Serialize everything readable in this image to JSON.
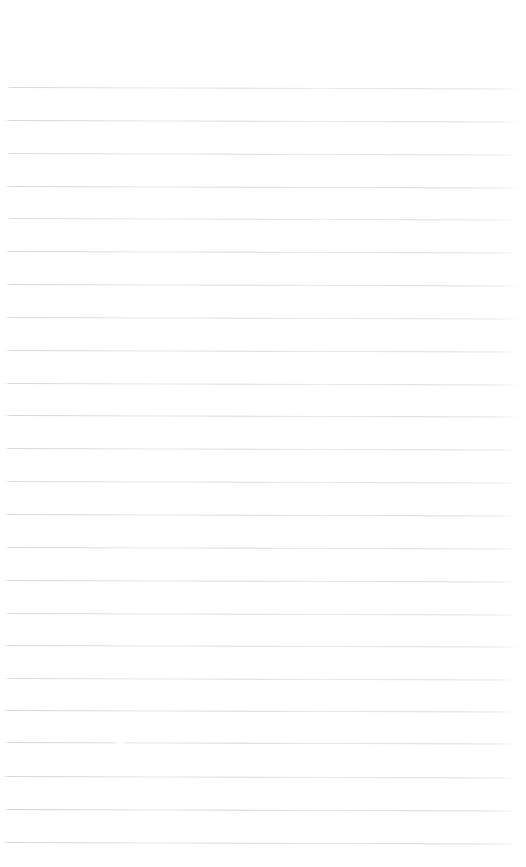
{
  "document": {
    "kind": "scanned-blank-ruled-paper",
    "page_label": "",
    "body_text": "",
    "has_text_content": false,
    "background_color": "#ffffff",
    "width_px": 526,
    "height_px": 867
  },
  "ruling": {
    "line_color": "#d4d7db",
    "line_color_dark": "#c6c9cd",
    "line_thickness_px": 1,
    "line_count": 24,
    "first_line_y": 87,
    "last_line_y": 842,
    "line_spacing_px": 32.8,
    "left_margin_px": 5,
    "right_edge_px": 521,
    "skew_degrees": 0.16,
    "top_blank_margin_px": 87,
    "bottom_blank_margin_px": 25,
    "lines": [
      {
        "y": 87,
        "x_start": 6,
        "x_end": 521,
        "opacity": 0.8
      },
      {
        "y": 120,
        "x_start": 5,
        "x_end": 521,
        "opacity": 0.86
      },
      {
        "y": 153,
        "x_start": 6,
        "x_end": 520,
        "opacity": 0.82
      },
      {
        "y": 186,
        "x_start": 5,
        "x_end": 521,
        "opacity": 0.88
      },
      {
        "y": 218,
        "x_start": 6,
        "x_end": 520,
        "opacity": 0.78
      },
      {
        "y": 251,
        "x_start": 5,
        "x_end": 521,
        "opacity": 0.84
      },
      {
        "y": 284,
        "x_start": 6,
        "x_end": 521,
        "opacity": 0.86
      },
      {
        "y": 317,
        "x_start": 5,
        "x_end": 520,
        "opacity": 0.8
      },
      {
        "y": 350,
        "x_start": 6,
        "x_end": 521,
        "opacity": 0.85
      },
      {
        "y": 383,
        "x_start": 5,
        "x_end": 521,
        "opacity": 0.82
      },
      {
        "y": 415,
        "x_start": 6,
        "x_end": 520,
        "opacity": 0.88
      },
      {
        "y": 448,
        "x_start": 5,
        "x_end": 521,
        "opacity": 0.84
      },
      {
        "y": 481,
        "x_start": 6,
        "x_end": 521,
        "opacity": 0.8
      },
      {
        "y": 514,
        "x_start": 5,
        "x_end": 520,
        "opacity": 0.86
      },
      {
        "y": 547,
        "x_start": 6,
        "x_end": 521,
        "opacity": 0.82
      },
      {
        "y": 580,
        "x_start": 5,
        "x_end": 521,
        "opacity": 0.88
      },
      {
        "y": 613,
        "x_start": 6,
        "x_end": 520,
        "opacity": 0.84
      },
      {
        "y": 645,
        "x_start": 5,
        "x_end": 521,
        "opacity": 0.86
      },
      {
        "y": 678,
        "x_start": 6,
        "x_end": 521,
        "opacity": 0.82
      },
      {
        "y": 710,
        "x_start": 5,
        "x_end": 520,
        "opacity": 0.9
      },
      {
        "y": 742,
        "x_start": 6,
        "x_end": 521,
        "opacity": 0.92
      },
      {
        "y": 776,
        "x_start": 5,
        "x_end": 521,
        "opacity": 0.88
      },
      {
        "y": 809,
        "x_start": 6,
        "x_end": 520,
        "opacity": 0.94
      },
      {
        "y": 842,
        "x_start": 5,
        "x_end": 521,
        "opacity": 0.9
      }
    ],
    "breaks": [
      {
        "y": 741,
        "x_start": 118,
        "width": 8
      }
    ]
  }
}
